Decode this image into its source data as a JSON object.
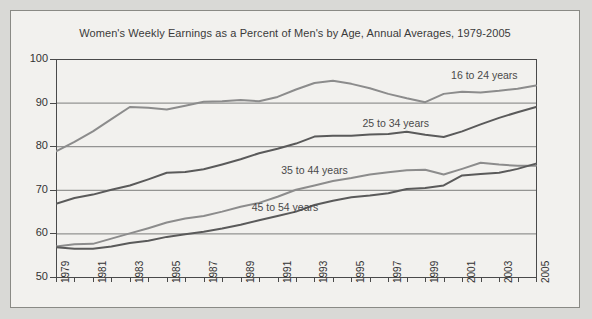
{
  "chart_data": {
    "type": "line",
    "title": "Women's Weekly Earnings as a Percent of Men's by Age, Annual Averages, 1979-2005",
    "xlabel": "",
    "ylabel": "",
    "ylim": [
      50,
      100
    ],
    "yticks": [
      50,
      60,
      70,
      80,
      90,
      100
    ],
    "xlim": [
      1979,
      2005
    ],
    "xticks": [
      1979,
      1981,
      1983,
      1985,
      1987,
      1989,
      1991,
      1993,
      1995,
      1997,
      1999,
      2001,
      2003,
      2005
    ],
    "xtick_labels": [
      "1979",
      "1981",
      "1983",
      "1985",
      "1987",
      "1989",
      "1991",
      "1993",
      "1995",
      "1997",
      "1999",
      "2001",
      "2003",
      "2005"
    ],
    "grid": true,
    "legend_position": "inline-labels",
    "x": [
      1979,
      1980,
      1981,
      1982,
      1983,
      1984,
      1985,
      1986,
      1987,
      1988,
      1989,
      1990,
      1991,
      1992,
      1993,
      1994,
      1995,
      1996,
      1997,
      1998,
      1999,
      2000,
      2001,
      2002,
      2003,
      2004,
      2005
    ],
    "series": [
      {
        "name": "16 to 24 years",
        "color": "#8c8c8c",
        "label_x": 2000.4,
        "label_y": 96.2,
        "values": [
          78.8,
          81.0,
          83.4,
          86.2,
          89.0,
          88.8,
          88.4,
          89.3,
          90.2,
          90.3,
          90.6,
          90.3,
          91.3,
          93.0,
          94.5,
          95.0,
          94.3,
          93.3,
          92.0,
          91.0,
          90.1,
          92.0,
          92.5,
          92.3,
          92.7,
          93.2,
          93.9
        ]
      },
      {
        "name": "25 to 34 years",
        "color": "#5a5a5a",
        "label_x": 1995.6,
        "label_y": 85.0,
        "values": [
          66.8,
          68.1,
          68.9,
          70.0,
          71.0,
          72.4,
          73.9,
          74.1,
          74.7,
          75.8,
          77.0,
          78.4,
          79.4,
          80.6,
          82.2,
          82.4,
          82.4,
          82.7,
          82.8,
          83.3,
          82.6,
          82.1,
          83.4,
          85.0,
          86.5,
          87.8,
          89.0
        ]
      },
      {
        "name": "35 to 44 years",
        "color": "#8c8c8c",
        "label_x": 1991.2,
        "label_y": 74.2,
        "values": [
          57.0,
          57.5,
          57.6,
          58.8,
          60.0,
          61.2,
          62.5,
          63.4,
          64.0,
          65.0,
          66.1,
          67.0,
          68.4,
          70.0,
          71.0,
          72.0,
          72.7,
          73.5,
          74.0,
          74.5,
          74.6,
          73.5,
          74.8,
          76.2,
          75.8,
          75.5,
          75.5
        ]
      },
      {
        "name": "45 to 54 years",
        "color": "#5a5a5a",
        "label_x": 1989.6,
        "label_y": 65.8,
        "values": [
          56.8,
          56.5,
          56.5,
          57.0,
          57.8,
          58.3,
          59.2,
          59.8,
          60.4,
          61.1,
          62.0,
          63.0,
          64.0,
          65.0,
          66.5,
          67.5,
          68.3,
          68.7,
          69.2,
          70.2,
          70.4,
          71.0,
          73.3,
          73.6,
          73.9,
          74.8,
          76.0
        ]
      }
    ]
  }
}
